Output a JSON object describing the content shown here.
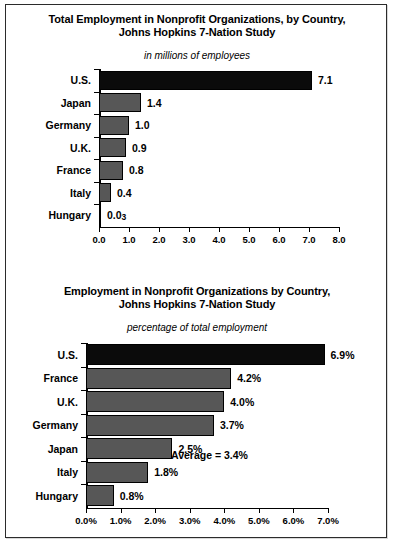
{
  "figure": {
    "background": "#ffffff",
    "border_color": "#2b2b2b",
    "bar_gray": "#575757",
    "bar_black": "#0b0b0b"
  },
  "chart_data": [
    {
      "id": "total-employment",
      "type": "bar",
      "orientation": "horizontal",
      "title_line1": "Total Employment in Nonprofit Organizations, by Country,",
      "title_line2": "Johns Hopkins 7-Nation Study",
      "subtitle": "in millions of employees",
      "xlabel": "",
      "ylabel": "",
      "xlim": [
        0,
        8
      ],
      "grid": false,
      "legend": "none",
      "xticks": [
        "0.0",
        "1.0",
        "2.0",
        "3.0",
        "4.0",
        "5.0",
        "6.0",
        "7.0",
        "8.0"
      ],
      "xtick_values": [
        0,
        1,
        2,
        3,
        4,
        5,
        6,
        7,
        8
      ],
      "categories": [
        "U.S.",
        "Japan",
        "Germany",
        "U.K.",
        "France",
        "Italy",
        "Hungary"
      ],
      "values": [
        7.1,
        1.4,
        1.0,
        0.9,
        0.8,
        0.4,
        0.03
      ],
      "value_labels": [
        "7.1",
        "1.4",
        "1.0",
        "0.9",
        "0.8",
        "0.4",
        "0.03"
      ],
      "highlight_index": 0,
      "bar_colors": [
        "#0b0b0b",
        "#575757",
        "#575757",
        "#575757",
        "#575757",
        "#575757",
        "#575757"
      ]
    },
    {
      "id": "percentage-employment",
      "type": "bar",
      "orientation": "horizontal",
      "title_line1": "Employment in Nonprofit Organizations by Country,",
      "title_line2": "Johns Hopkins 7-Nation Study",
      "subtitle": "percentage of total employment",
      "xlabel": "",
      "ylabel": "",
      "xlim": [
        0,
        7
      ],
      "grid": false,
      "legend": "none",
      "annotation": "Average = 3.4%",
      "xticks": [
        "0.0%",
        "1.0%",
        "2.0%",
        "3.0%",
        "4.0%",
        "5.0%",
        "6.0%",
        "7.0%"
      ],
      "xtick_values": [
        0,
        1,
        2,
        3,
        4,
        5,
        6,
        7
      ],
      "categories": [
        "U.S.",
        "France",
        "U.K.",
        "Germany",
        "Japan",
        "Italy",
        "Hungary"
      ],
      "values": [
        6.9,
        4.2,
        4.0,
        3.7,
        2.5,
        1.8,
        0.8
      ],
      "value_labels": [
        "6.9%",
        "4.2%",
        "4.0%",
        "3.7%",
        "2.5%",
        "1.8%",
        "0.8%"
      ],
      "highlight_index": 0,
      "bar_colors": [
        "#0b0b0b",
        "#575757",
        "#575757",
        "#575757",
        "#575757",
        "#575757",
        "#575757"
      ]
    }
  ]
}
